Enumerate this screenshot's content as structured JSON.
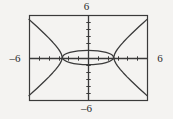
{
  "figure": {
    "kind": "graphing-calculator-plot",
    "background_color": "#f4f3f1",
    "stroke_color": "#3a3a3a",
    "frame": {
      "x": 29,
      "y": 15,
      "width": 118,
      "height": 85
    },
    "labels": {
      "top": "6",
      "bottom": "–6",
      "left": "–6",
      "right": "6"
    }
  },
  "chart_data": {
    "type": "line",
    "title": "",
    "xlabel": "",
    "ylabel": "",
    "xlim": [
      -6,
      6
    ],
    "ylim": [
      -6,
      6
    ],
    "xticks": [
      -5,
      -4,
      -3,
      -2,
      -1,
      1,
      2,
      3,
      4,
      5
    ],
    "yticks": [
      -5,
      -4,
      -3,
      -2,
      -1,
      1,
      2,
      3,
      4,
      5
    ],
    "grid": false,
    "legend": false,
    "axes_style": "centered-crosshair-with-box-frame",
    "tick_labels": {
      "x_min": "–6",
      "x_max": "6",
      "y_min": "–6",
      "y_max": "6"
    },
    "series": [
      {
        "name": "hyperbola-left-branch-upper",
        "equation": "x^2/6.8 - y^2/9 = 1 (x <= -2.6, y >= 0)",
        "x": [
          -6.0,
          -5.6,
          -5.2,
          -4.8,
          -4.4,
          -4.0,
          -3.6,
          -3.3,
          -3.0,
          -2.85,
          -2.7,
          -2.61
        ],
        "y": [
          5.38,
          4.88,
          4.37,
          3.85,
          3.32,
          2.77,
          2.18,
          1.71,
          1.18,
          0.86,
          0.45,
          0.0
        ]
      },
      {
        "name": "hyperbola-left-branch-lower",
        "equation": "x^2/6.8 - y^2/9 = 1 (x <= -2.6, y <= 0)",
        "x": [
          -6.0,
          -5.6,
          -5.2,
          -4.8,
          -4.4,
          -4.0,
          -3.6,
          -3.3,
          -3.0,
          -2.85,
          -2.7,
          -2.61
        ],
        "y": [
          -5.38,
          -4.88,
          -4.37,
          -3.85,
          -3.32,
          -2.77,
          -2.18,
          -1.71,
          -1.18,
          -0.86,
          -0.45,
          0.0
        ]
      },
      {
        "name": "hyperbola-right-branch-upper",
        "equation": "x^2/6.8 - y^2/9 = 1 (x >= 2.6, y >= 0)",
        "x": [
          2.61,
          2.7,
          2.85,
          3.0,
          3.3,
          3.6,
          4.0,
          4.4,
          4.8,
          5.2,
          5.6,
          6.0
        ],
        "y": [
          0.0,
          0.45,
          0.86,
          1.18,
          1.71,
          2.18,
          2.77,
          3.32,
          3.85,
          4.37,
          4.88,
          5.38
        ]
      },
      {
        "name": "hyperbola-right-branch-lower",
        "equation": "x^2/6.8 - y^2/9 = 1 (x >= 2.6, y <= 0)",
        "x": [
          2.61,
          2.7,
          2.85,
          3.0,
          3.3,
          3.6,
          4.0,
          4.4,
          4.8,
          5.2,
          5.6,
          6.0
        ],
        "y": [
          0.0,
          -0.45,
          -0.86,
          -1.18,
          -1.71,
          -2.18,
          -2.77,
          -3.32,
          -3.85,
          -4.37,
          -4.88,
          -5.38
        ]
      },
      {
        "name": "ellipse",
        "equation": "x^2/6.8 + y^2/1.0 = 1",
        "center": [
          0,
          0
        ],
        "semi_axis_x": 2.6,
        "semi_axis_y": 1.0
      }
    ]
  }
}
